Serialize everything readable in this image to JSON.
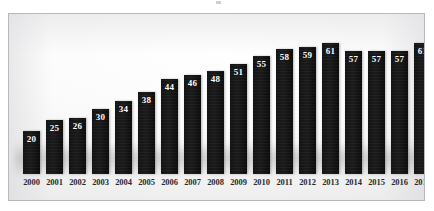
{
  "chart_data": {
    "type": "bar",
    "title": "",
    "subtitle": "",
    "xlabel": "",
    "ylabel": "",
    "categories": [
      "2000",
      "2001",
      "2002",
      "2003",
      "2004",
      "2005",
      "2006",
      "2007",
      "2008",
      "2009",
      "2010",
      "2011",
      "2012",
      "2013",
      "2014",
      "2015",
      "2016",
      "2017"
    ],
    "values": [
      20,
      25,
      26,
      30,
      34,
      38,
      44,
      46,
      48,
      51,
      55,
      58,
      59,
      61,
      57,
      57,
      57,
      61
    ],
    "ylim": [
      0,
      65
    ],
    "grid": false,
    "legend": false,
    "legend_position": "none",
    "data_labels": true,
    "bar_color": "#141414",
    "data_label_color": "#ffffff",
    "axis_label_color": "#2a2a2e",
    "background_color": "#f7f7f7",
    "frame_color": "#b9b9bd"
  }
}
